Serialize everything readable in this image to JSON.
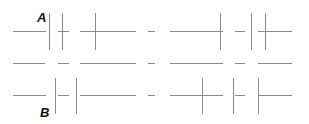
{
  "labels": {
    "a": "A",
    "b": "B"
  },
  "colors": {
    "line": "#8a8a8a",
    "background": "#ffffff",
    "label": "#111111"
  },
  "rows": [
    {
      "name": "top",
      "y": 31,
      "segments": [
        [
          13,
          46
        ],
        [
          58,
          69
        ],
        [
          80,
          136
        ],
        [
          148,
          155
        ],
        [
          170,
          223
        ],
        [
          235,
          245
        ],
        [
          258,
          292
        ]
      ],
      "verticals": [
        {
          "x": 49,
          "y1": 13,
          "y2": 50
        },
        {
          "x": 62,
          "y1": 13,
          "y2": 50
        },
        {
          "x": 95,
          "y1": 13,
          "y2": 50
        },
        {
          "x": 220,
          "y1": 13,
          "y2": 50
        },
        {
          "x": 251,
          "y1": 13,
          "y2": 50
        },
        {
          "x": 265,
          "y1": 13,
          "y2": 50
        }
      ]
    },
    {
      "name": "middle",
      "y": 63,
      "segments": [
        [
          13,
          45
        ],
        [
          58,
          69
        ],
        [
          80,
          136
        ],
        [
          148,
          155
        ],
        [
          170,
          223
        ],
        [
          235,
          245
        ],
        [
          258,
          292
        ]
      ],
      "verticals": []
    },
    {
      "name": "bottom",
      "y": 95,
      "segments": [
        [
          13,
          46
        ],
        [
          58,
          69
        ],
        [
          80,
          136
        ],
        [
          148,
          155
        ],
        [
          170,
          223
        ],
        [
          235,
          245
        ],
        [
          258,
          292
        ]
      ],
      "verticals": [
        {
          "x": 55,
          "y1": 78,
          "y2": 114
        },
        {
          "x": 76,
          "y1": 78,
          "y2": 114
        },
        {
          "x": 202,
          "y1": 78,
          "y2": 114
        },
        {
          "x": 233,
          "y1": 78,
          "y2": 114
        },
        {
          "x": 258,
          "y1": 78,
          "y2": 114
        }
      ]
    }
  ]
}
